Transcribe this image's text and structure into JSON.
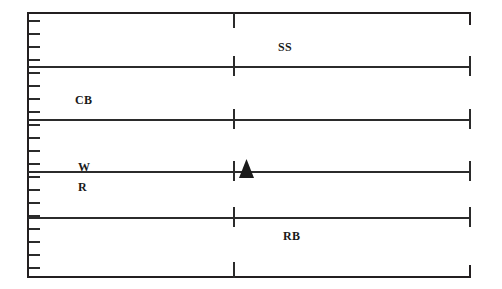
{
  "figure": {
    "type": "stratigraphic-core-log",
    "background_color": "#ffffff",
    "line_color": "#2b2b2b",
    "frame_color": "#231f20",
    "marker_color": "#1a1a1a"
  },
  "frame": {
    "left_border": {
      "x": 27,
      "y": 12,
      "height": 266
    },
    "top_border": {
      "x": 27,
      "y": 12,
      "width": 444
    },
    "bottom_border": {
      "x": 27,
      "y": 276,
      "width": 444
    },
    "right_bracket_top": {
      "x": 469,
      "y": 12,
      "height": 13
    },
    "right_bracket_bottom": {
      "x": 469,
      "y": 265,
      "height": 13
    }
  },
  "division_lines": [
    {
      "y": 66,
      "width": 442
    },
    {
      "y": 119,
      "width": 442
    },
    {
      "y": 171,
      "width": 442
    },
    {
      "y": 217,
      "width": 442
    }
  ],
  "ruler_ticks": {
    "x": 29,
    "length": 11,
    "positions": [
      20,
      33,
      46,
      59,
      72,
      85,
      98,
      111,
      124,
      137,
      150,
      163,
      176,
      189,
      202,
      215,
      228,
      241,
      254,
      267
    ]
  },
  "center_ticks": {
    "x": 233,
    "marks": [
      {
        "y": 12,
        "height": 16
      },
      {
        "y": 56,
        "height": 20
      },
      {
        "y": 109,
        "height": 20
      },
      {
        "y": 161,
        "height": 20
      },
      {
        "y": 207,
        "height": 20
      },
      {
        "y": 262,
        "height": 16
      }
    ]
  },
  "right_ticks": {
    "x": 469,
    "marks": [
      {
        "y": 56,
        "height": 20
      },
      {
        "y": 109,
        "height": 20
      },
      {
        "y": 161,
        "height": 20
      },
      {
        "y": 207,
        "height": 20
      }
    ]
  },
  "labels": [
    {
      "name": "label-ss",
      "text": "SS",
      "x": 278,
      "y": 40
    },
    {
      "name": "label-cb",
      "text": "CB",
      "x": 75,
      "y": 93
    },
    {
      "name": "label-w",
      "text": "W",
      "x": 78,
      "y": 160
    },
    {
      "name": "label-r",
      "text": "R",
      "x": 78,
      "y": 180
    },
    {
      "name": "label-rb",
      "text": "RB",
      "x": 283,
      "y": 229
    }
  ],
  "marker": {
    "name": "triangle-marker",
    "shape": "filled-up-triangle",
    "x": 239,
    "y": 159,
    "width": 15,
    "height": 19,
    "color": "#1a1a1a"
  },
  "legend_keys": {
    "SS": "SS",
    "CB": "CB",
    "W": "W",
    "R": "R",
    "RB": "RB"
  }
}
